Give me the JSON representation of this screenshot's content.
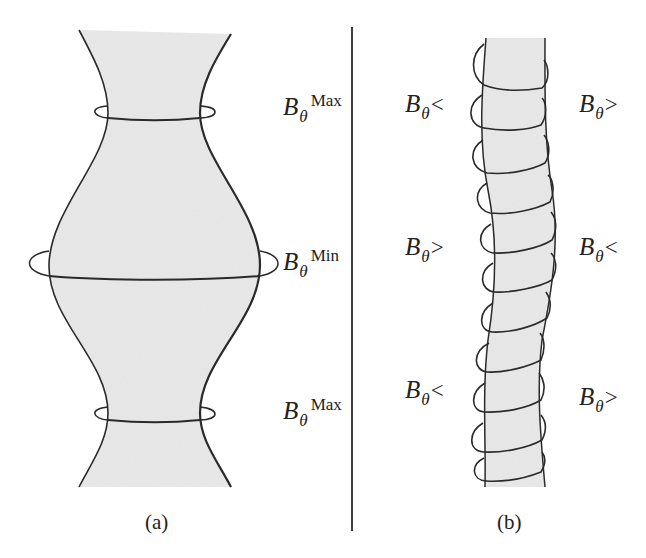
{
  "figure": {
    "panel_a": {
      "caption": "(a)",
      "labels": [
        {
          "symbol": "B",
          "subscript": "θ",
          "superscript": "Max"
        },
        {
          "symbol": "B",
          "subscript": "θ",
          "superscript": "Min"
        },
        {
          "symbol": "B",
          "subscript": "θ",
          "superscript": "Max"
        }
      ]
    },
    "panel_b": {
      "caption": "(b)",
      "labels_left": [
        {
          "symbol": "B",
          "subscript": "θ",
          "relation": "<"
        },
        {
          "symbol": "B",
          "subscript": "θ",
          "relation": ">"
        },
        {
          "symbol": "B",
          "subscript": "θ",
          "relation": "<"
        }
      ],
      "labels_right": [
        {
          "symbol": "B",
          "subscript": "θ",
          "relation": ">"
        },
        {
          "symbol": "B",
          "subscript": "θ",
          "relation": "<"
        },
        {
          "symbol": "B",
          "subscript": "θ",
          "relation": ">"
        }
      ]
    },
    "colors": {
      "fill": "#e6e6e6",
      "stroke": "#2a2a2a"
    }
  }
}
